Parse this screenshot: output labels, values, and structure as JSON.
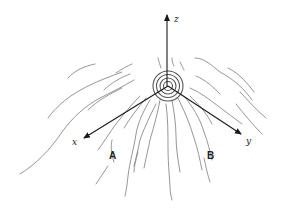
{
  "diagram": {
    "type": "3d-coordinate-axes-with-growth-rings",
    "axes": {
      "z": {
        "label": "z"
      },
      "x": {
        "label": "x"
      },
      "y": {
        "label": "y"
      }
    },
    "regions": {
      "a": {
        "label": "A"
      },
      "b": {
        "label": "B"
      }
    },
    "center": {
      "element": "concentric-rings"
    },
    "colors": {
      "axis": "#1a1a1a",
      "grain": "#8a8a8a",
      "rings": "#555555",
      "background": "#ffffff"
    }
  }
}
